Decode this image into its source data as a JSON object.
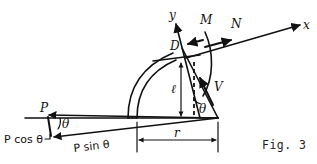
{
  "figure": {
    "caption": "Fig. 3",
    "type": "free-body-diagram"
  },
  "axes": {
    "x_label": "x",
    "y_label": "y",
    "origin_label": "D"
  },
  "internal_forces": {
    "moment_label": "M",
    "normal_label": "N",
    "shear_label": "V"
  },
  "dimensions": {
    "vertical_label": "ℓ",
    "horizontal_label": "r"
  },
  "angles": {
    "section_angle_label": "θ",
    "force_angle_label": "θ"
  },
  "applied_load": {
    "resultant_label": "P",
    "vertical_component_label": "P cos θ",
    "horizontal_component_label": "P sin θ"
  },
  "colors": {
    "ink": "#111111",
    "background": "#ffffff"
  }
}
